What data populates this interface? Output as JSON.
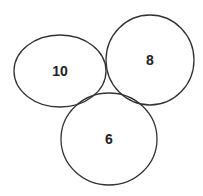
{
  "diagram": {
    "type": "overlapping-ellipses",
    "stroke_color": "#333333",
    "background": "#ffffff",
    "nodes": [
      {
        "id": "left",
        "label": "10",
        "cx": 60,
        "cy": 71,
        "rx": 46,
        "ry": 36
      },
      {
        "id": "right",
        "label": "8",
        "cx": 150,
        "cy": 60,
        "rx": 44,
        "ry": 45
      },
      {
        "id": "bottom",
        "label": "6",
        "cx": 109,
        "cy": 139,
        "rx": 48,
        "ry": 46
      }
    ]
  }
}
